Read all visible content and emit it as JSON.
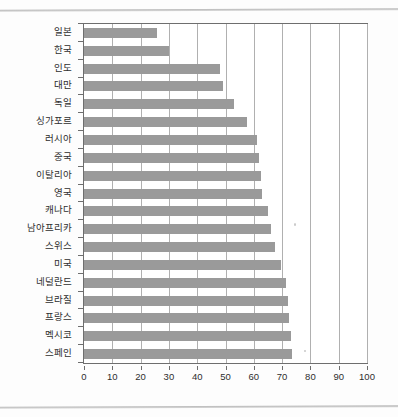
{
  "chart_data": {
    "type": "bar",
    "orientation": "horizontal",
    "title": "",
    "subtitle": "",
    "xlabel": "",
    "ylabel": "",
    "xlim": [
      0,
      100
    ],
    "ylim": null,
    "grid": true,
    "grid_axis": "x",
    "legend": false,
    "legend_position": "none",
    "bar_color": "#9a9a9a",
    "axis_color": "#6e6e6e",
    "gridline_color": "#b0b0b0",
    "categories": [
      "일본",
      "한국",
      "인도",
      "대만",
      "독일",
      "싱가포르",
      "러시아",
      "중국",
      "이탈리아",
      "영국",
      "캐나다",
      "남아프리카",
      "스위스",
      "미국",
      "네덜란드",
      "브라질",
      "프랑스",
      "멕시코",
      "스페인"
    ],
    "values": [
      25.8,
      30.0,
      48.0,
      49.0,
      53.0,
      57.5,
      61.0,
      62.0,
      62.5,
      63.0,
      65.0,
      66.0,
      67.5,
      69.5,
      71.5,
      72.0,
      72.5,
      73.0,
      73.5
    ],
    "xticks": [
      0,
      10,
      20,
      30,
      40,
      50,
      60,
      70,
      80,
      90,
      100
    ],
    "xticklabels": [
      "0",
      "10",
      "20",
      "30",
      "40",
      "50",
      "60",
      "70",
      "80",
      "90",
      "100"
    ]
  }
}
